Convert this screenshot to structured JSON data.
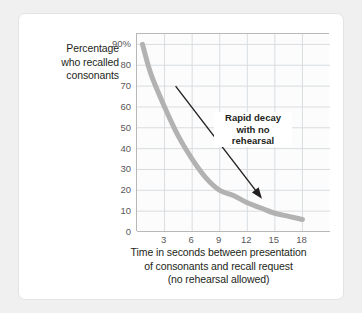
{
  "chart_data": {
    "type": "line",
    "title": "",
    "xlabel": "Time in seconds between presentation of consonants and recall request (no rehearsal allowed)",
    "ylabel": "Percentage who recalled consonants",
    "xlim": [
      0,
      21
    ],
    "ylim": [
      0,
      95
    ],
    "grid": true,
    "legend_position": "none",
    "x_ticks": [
      "3",
      "6",
      "9",
      "12",
      "15",
      "18"
    ],
    "x_tick_values": [
      3,
      6,
      9,
      12,
      15,
      18
    ],
    "y_ticks": [
      "90%",
      "80",
      "70",
      "60",
      "50",
      "40",
      "30",
      "20",
      "10",
      "0"
    ],
    "y_tick_values": [
      90,
      80,
      70,
      60,
      50,
      40,
      30,
      20,
      10,
      0
    ],
    "series": [
      {
        "name": "Percentage who recalled consonants",
        "color": "#b2b2b2",
        "x": [
          0.6,
          1.5,
          3,
          4.5,
          6,
          7.5,
          9,
          10.5,
          12,
          13.5,
          15,
          16.5,
          18
        ],
        "values": [
          90,
          76,
          60,
          46,
          35,
          26,
          20,
          17.5,
          14,
          11.5,
          9,
          7.5,
          6
        ]
      }
    ],
    "annotations": [
      {
        "text": "Rapid decay with no rehearsal",
        "lines": [
          "Rapid decay",
          "with no",
          "rehearsal"
        ],
        "arrow_from": [
          4.2,
          70
        ],
        "arrow_to": [
          13.6,
          16
        ]
      }
    ]
  },
  "axes": {
    "y_title_lines": [
      "Percentage",
      "who recalled",
      "consonants"
    ],
    "x_title_lines": [
      "Time in seconds between presentation",
      "of consonants and recall request",
      "(no rehearsal allowed)"
    ]
  },
  "colors": {
    "curve": "#b2b2b2",
    "grid": "#d9dde0",
    "axis": "#b8b8b8",
    "text": "#231f20",
    "tick_text": "#59585a",
    "arrow": "#231f20",
    "card": "#ffffff",
    "page": "#f0f0f0"
  }
}
